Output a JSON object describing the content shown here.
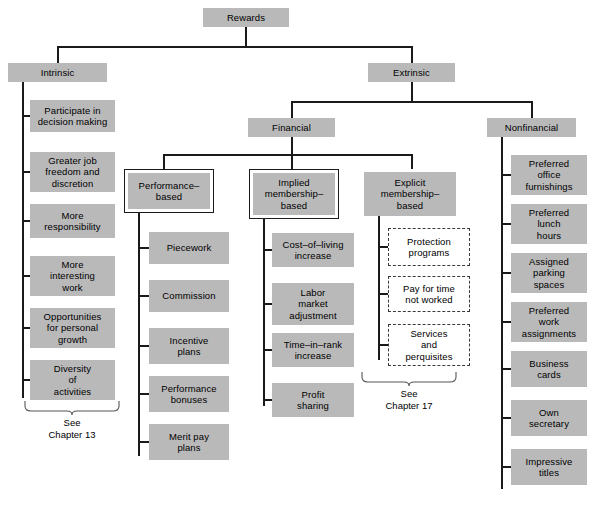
{
  "figure": {
    "title": "Rewards",
    "bottom_caption": ""
  },
  "colors": {
    "node_fill": "#b9b9b9",
    "line": "#1a1a1a",
    "dashed_border": "#3a3a3a",
    "background": "#ffffff"
  },
  "nodes": {
    "root": {
      "label": "Rewards"
    },
    "intrinsic": {
      "label": "Intrinsic"
    },
    "extrinsic": {
      "label": "Extrinsic"
    },
    "financial": {
      "label": "Financial"
    },
    "nonfinancial": {
      "label": "Nonfinancial"
    },
    "performance_based": {
      "label": "Performance–\nbased"
    },
    "implied_membership_based": {
      "label": "Implied\nmembership–\nbased"
    },
    "explicit_membership_based": {
      "label": "Explicit\nmembership–\nbased"
    }
  },
  "intrinsic_items": [
    {
      "label": "Participate in\ndecision making"
    },
    {
      "label": "Greater job\nfreedom and\ndiscretion"
    },
    {
      "label": "More\nresponsibility"
    },
    {
      "label": "More\ninteresting\nwork"
    },
    {
      "label": "Opportunities\nfor personal\ngrowth"
    },
    {
      "label": "Diversity\nof\nactivities"
    }
  ],
  "performance_items": [
    {
      "label": "Piecework"
    },
    {
      "label": "Commission"
    },
    {
      "label": "Incentive\nplans"
    },
    {
      "label": "Performance\nbonuses"
    },
    {
      "label": "Merit pay\nplans"
    }
  ],
  "implied_items": [
    {
      "label": "Cost–of–living\nincrease"
    },
    {
      "label": "Labor\nmarket\nadjustment"
    },
    {
      "label": "Time–in–rank\nincrease"
    },
    {
      "label": "Profit\nsharing"
    }
  ],
  "explicit_items": [
    {
      "label": "Protection\nprograms"
    },
    {
      "label": "Pay for time\nnot worked"
    },
    {
      "label": "Services\nand\nperquisites"
    }
  ],
  "nonfinancial_items": [
    {
      "label": "Preferred\noffice\nfurnishings"
    },
    {
      "label": "Preferred\nlunch\nhours"
    },
    {
      "label": "Assigned\nparking\nspaces"
    },
    {
      "label": "Preferred\nwork\nassignments"
    },
    {
      "label": "Business\ncards"
    },
    {
      "label": "Own\nsecretary"
    },
    {
      "label": "Impressive\ntitles"
    }
  ],
  "annotations": {
    "intrinsic_ref": "See\nChapter 13",
    "explicit_ref": "See\nChapter 17"
  }
}
